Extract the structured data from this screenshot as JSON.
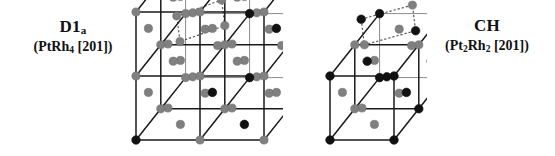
{
  "figure": {
    "background_color": "#ffffff",
    "width": 555,
    "height": 156
  },
  "palette": {
    "atom_dark": "#111111",
    "atom_light": "#808080",
    "edge_dark": "#1a1a1a",
    "edge_light": "#8c8c8c",
    "plane_marker": "#555555"
  },
  "structures": [
    {
      "id": "d1a",
      "title": "D1",
      "title_sub": "a",
      "formula_prefix": "(PtRh",
      "formula_sub": "4",
      "formula_suffix": " [201])",
      "formula_plain": "(PtRh4 [201])",
      "cells_x": 2,
      "cells_y": 2,
      "cells_z": 2,
      "plane_index": "[201]",
      "cell_px": 64,
      "depth_px": 40,
      "origin_x": 18,
      "origin_y": 140,
      "corners": [
        {
          "i": 0,
          "j": 0,
          "k": 0,
          "color": "dark"
        },
        {
          "i": 1,
          "j": 0,
          "k": 0,
          "color": "light"
        },
        {
          "i": 2,
          "j": 0,
          "k": 0,
          "color": "light"
        },
        {
          "i": 0,
          "j": 1,
          "k": 0,
          "color": "light"
        },
        {
          "i": 1,
          "j": 1,
          "k": 0,
          "color": "light"
        },
        {
          "i": 2,
          "j": 1,
          "k": 0,
          "color": "light"
        },
        {
          "i": 0,
          "j": 2,
          "k": 0,
          "color": "light"
        },
        {
          "i": 1,
          "j": 2,
          "k": 0,
          "color": "dark"
        },
        {
          "i": 2,
          "j": 2,
          "k": 0,
          "color": "light"
        },
        {
          "i": 0,
          "j": 0,
          "k": 1,
          "color": "light"
        },
        {
          "i": 1,
          "j": 0,
          "k": 1,
          "color": "light"
        },
        {
          "i": 2,
          "j": 0,
          "k": 1,
          "color": "light"
        },
        {
          "i": 0,
          "j": 1,
          "k": 1,
          "color": "light"
        },
        {
          "i": 1,
          "j": 1,
          "k": 1,
          "color": "light"
        },
        {
          "i": 2,
          "j": 1,
          "k": 1,
          "color": "light"
        },
        {
          "i": 0,
          "j": 2,
          "k": 1,
          "color": "light"
        },
        {
          "i": 1,
          "j": 2,
          "k": 1,
          "color": "dark"
        },
        {
          "i": 2,
          "j": 2,
          "k": 1,
          "color": "light"
        },
        {
          "i": 0,
          "j": 0,
          "k": 2,
          "color": "light"
        },
        {
          "i": 1,
          "j": 0,
          "k": 2,
          "color": "light"
        },
        {
          "i": 2,
          "j": 0,
          "k": 2,
          "color": "light"
        },
        {
          "i": 0,
          "j": 1,
          "k": 2,
          "color": "light"
        },
        {
          "i": 1,
          "j": 1,
          "k": 2,
          "color": "dark"
        },
        {
          "i": 2,
          "j": 1,
          "k": 2,
          "color": "light"
        },
        {
          "i": 0,
          "j": 2,
          "k": 2,
          "color": "light"
        },
        {
          "i": 1,
          "j": 2,
          "k": 2,
          "color": "light"
        },
        {
          "i": 2,
          "j": 2,
          "k": 2,
          "color": "light"
        }
      ],
      "faces": [
        {
          "x": 0.5,
          "y": 0.5,
          "z": 0,
          "color": "light"
        },
        {
          "x": 1.5,
          "y": 0.5,
          "z": 0,
          "color": "dark"
        },
        {
          "x": 0.5,
          "y": 1.5,
          "z": 0,
          "color": "light"
        },
        {
          "x": 1.5,
          "y": 1.5,
          "z": 0,
          "color": "light"
        },
        {
          "x": 0.5,
          "y": 0.5,
          "z": 1,
          "color": "light"
        },
        {
          "x": 1.5,
          "y": 0.5,
          "z": 1,
          "color": "light"
        },
        {
          "x": 0.5,
          "y": 1.5,
          "z": 1,
          "color": "light"
        },
        {
          "x": 1.5,
          "y": 1.5,
          "z": 1,
          "color": "light"
        },
        {
          "x": 0.5,
          "y": 0.5,
          "z": 2,
          "color": "light"
        },
        {
          "x": 1.5,
          "y": 0.5,
          "z": 2,
          "color": "light"
        },
        {
          "x": 0.5,
          "y": 1.5,
          "z": 2,
          "color": "light"
        },
        {
          "x": 1.5,
          "y": 1.5,
          "z": 2,
          "color": "light"
        },
        {
          "x": 0,
          "y": 0.5,
          "z": 0.5,
          "color": "light"
        },
        {
          "x": 1,
          "y": 0.5,
          "z": 0.5,
          "color": "dark"
        },
        {
          "x": 2,
          "y": 0.5,
          "z": 0.5,
          "color": "light"
        },
        {
          "x": 0,
          "y": 1.5,
          "z": 0.5,
          "color": "light"
        },
        {
          "x": 1,
          "y": 1.5,
          "z": 0.5,
          "color": "light"
        },
        {
          "x": 2,
          "y": 1.5,
          "z": 0.5,
          "color": "dark"
        },
        {
          "x": 0,
          "y": 0.5,
          "z": 1.5,
          "color": "light"
        },
        {
          "x": 1,
          "y": 0.5,
          "z": 1.5,
          "color": "light"
        },
        {
          "x": 2,
          "y": 0.5,
          "z": 1.5,
          "color": "dark"
        },
        {
          "x": 0,
          "y": 1.5,
          "z": 1.5,
          "color": "light"
        },
        {
          "x": 1,
          "y": 1.5,
          "z": 1.5,
          "color": "light"
        },
        {
          "x": 2,
          "y": 1.5,
          "z": 1.5,
          "color": "light"
        },
        {
          "x": 0.5,
          "y": 0,
          "z": 0.5,
          "color": "light"
        },
        {
          "x": 1.5,
          "y": 0,
          "z": 0.5,
          "color": "light"
        },
        {
          "x": 0.5,
          "y": 1,
          "z": 0.5,
          "color": "light"
        },
        {
          "x": 1.5,
          "y": 1,
          "z": 0.5,
          "color": "light"
        },
        {
          "x": 0.5,
          "y": 2,
          "z": 0.5,
          "color": "light"
        },
        {
          "x": 1.5,
          "y": 2,
          "z": 0.5,
          "color": "light"
        },
        {
          "x": 0.5,
          "y": 0,
          "z": 1.5,
          "color": "light"
        },
        {
          "x": 1.5,
          "y": 0,
          "z": 1.5,
          "color": "light"
        },
        {
          "x": 0.5,
          "y": 1,
          "z": 1.5,
          "color": "light"
        },
        {
          "x": 1.5,
          "y": 1,
          "z": 1.5,
          "color": "light"
        },
        {
          "x": 0.5,
          "y": 2,
          "z": 1.5,
          "color": "light"
        },
        {
          "x": 1.5,
          "y": 2,
          "z": 1.5,
          "color": "light"
        }
      ],
      "plane_markers": [
        {
          "x": 0.25,
          "y": 1.0,
          "z": 1.45,
          "color": "light"
        },
        {
          "x": 0.95,
          "y": 1.0,
          "z": 1.7,
          "color": "light"
        },
        {
          "x": 1.0,
          "y": 1.0,
          "z": 1.3,
          "color": "light"
        },
        {
          "x": 0.3,
          "y": 1.0,
          "z": 1.05,
          "color": "light"
        }
      ]
    },
    {
      "id": "ch",
      "title": "CH",
      "title_sub": "",
      "formula_prefix": "(Pt",
      "formula_sub": "2",
      "formula_mid": "Rh",
      "formula_sub2": "2",
      "formula_suffix": " [201])",
      "formula_plain": "(Pt2Rh2 [201])",
      "cells_x": 1,
      "cells_y": 2,
      "cells_z": 1,
      "plane_index": "[201]",
      "cell_px": 64,
      "depth_px": 40,
      "origin_x": 18,
      "origin_y": 140,
      "corners": [
        {
          "i": 0,
          "j": 0,
          "k": 0,
          "color": "dark"
        },
        {
          "i": 1,
          "j": 0,
          "k": 0,
          "color": "dark"
        },
        {
          "i": 0,
          "j": 1,
          "k": 0,
          "color": "light"
        },
        {
          "i": 1,
          "j": 1,
          "k": 0,
          "color": "dark"
        },
        {
          "i": 0,
          "j": 2,
          "k": 0,
          "color": "dark"
        },
        {
          "i": 1,
          "j": 2,
          "k": 0,
          "color": "dark"
        },
        {
          "i": 0,
          "j": 0,
          "k": 1,
          "color": "dark"
        },
        {
          "i": 1,
          "j": 0,
          "k": 1,
          "color": "dark"
        },
        {
          "i": 0,
          "j": 1,
          "k": 1,
          "color": "light"
        },
        {
          "i": 1,
          "j": 1,
          "k": 1,
          "color": "light"
        },
        {
          "i": 0,
          "j": 2,
          "k": 1,
          "color": "dark"
        },
        {
          "i": 1,
          "j": 2,
          "k": 1,
          "color": "dark"
        }
      ],
      "faces": [
        {
          "x": 0.5,
          "y": 0.5,
          "z": 0,
          "color": "light"
        },
        {
          "x": 0.5,
          "y": 1.5,
          "z": 0,
          "color": "light"
        },
        {
          "x": 0.5,
          "y": 0.5,
          "z": 1,
          "color": "light"
        },
        {
          "x": 0.5,
          "y": 1.5,
          "z": 1,
          "color": "light"
        },
        {
          "x": 0,
          "y": 0.5,
          "z": 0.5,
          "color": "light"
        },
        {
          "x": 1,
          "y": 0.5,
          "z": 0.5,
          "color": "dark"
        },
        {
          "x": 0,
          "y": 1.5,
          "z": 0.5,
          "color": "dark"
        },
        {
          "x": 1,
          "y": 1.5,
          "z": 0.5,
          "color": "dark"
        },
        {
          "x": 0.5,
          "y": 0,
          "z": 0.5,
          "color": "light"
        },
        {
          "x": 0.5,
          "y": 1,
          "z": 0.5,
          "color": "dark"
        },
        {
          "x": 0.5,
          "y": 2,
          "z": 0.5,
          "color": "light"
        }
      ],
      "plane_markers": [
        {
          "x": 0.1,
          "y": 1.0,
          "z": 1.4,
          "color": "dark"
        },
        {
          "x": 0.9,
          "y": 1.0,
          "z": 1.62,
          "color": "light"
        },
        {
          "x": 0.95,
          "y": 1.0,
          "z": 1.22,
          "color": "dark"
        },
        {
          "x": 0.15,
          "y": 1.0,
          "z": 1.0,
          "color": "light"
        }
      ]
    }
  ],
  "legend": {
    "dark_atom_meaning": "Pt",
    "light_atom_meaning": "Rh"
  }
}
